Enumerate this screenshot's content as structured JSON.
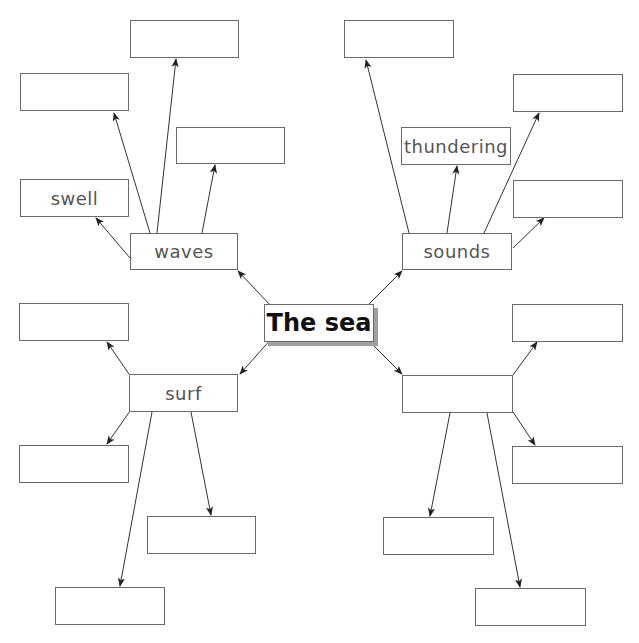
{
  "diagram": {
    "type": "mind-map",
    "center": {
      "label": "The sea",
      "x": 264,
      "y": 304,
      "w": 110,
      "h": 38
    },
    "branches": [
      {
        "id": "waves",
        "label": "waves",
        "box": {
          "x": 130,
          "y": 233,
          "w": 108,
          "h": 37
        },
        "children": [
          {
            "label": "",
            "box": {
              "x": 130,
              "y": 20,
              "w": 109,
              "h": 38
            }
          },
          {
            "label": "",
            "box": {
              "x": 20,
              "y": 73,
              "w": 109,
              "h": 38
            }
          },
          {
            "label": "",
            "box": {
              "x": 176,
              "y": 127,
              "w": 109,
              "h": 37
            }
          },
          {
            "label": "swell",
            "box": {
              "x": 20,
              "y": 179,
              "w": 109,
              "h": 38
            }
          }
        ]
      },
      {
        "id": "sounds",
        "label": "sounds",
        "box": {
          "x": 402,
          "y": 233,
          "w": 110,
          "h": 37
        },
        "children": [
          {
            "label": "",
            "box": {
              "x": 344,
              "y": 20,
              "w": 110,
              "h": 38
            }
          },
          {
            "label": "",
            "box": {
              "x": 513,
              "y": 74,
              "w": 110,
              "h": 38
            }
          },
          {
            "label": "thundering",
            "box": {
              "x": 401,
              "y": 127,
              "w": 110,
              "h": 38
            }
          },
          {
            "label": "",
            "box": {
              "x": 513,
              "y": 180,
              "w": 110,
              "h": 38
            }
          }
        ]
      },
      {
        "id": "surf",
        "label": "surf",
        "box": {
          "x": 129,
          "y": 374,
          "w": 109,
          "h": 38
        },
        "children": [
          {
            "label": "",
            "box": {
              "x": 19,
              "y": 303,
              "w": 110,
              "h": 38
            }
          },
          {
            "label": "",
            "box": {
              "x": 19,
              "y": 445,
              "w": 110,
              "h": 38
            }
          },
          {
            "label": "",
            "box": {
              "x": 147,
              "y": 516,
              "w": 109,
              "h": 38
            }
          },
          {
            "label": "",
            "box": {
              "x": 55,
              "y": 587,
              "w": 110,
              "h": 38
            }
          }
        ]
      },
      {
        "id": "unnamed",
        "label": "",
        "box": {
          "x": 402,
          "y": 375,
          "w": 111,
          "h": 38
        },
        "children": [
          {
            "label": "",
            "box": {
              "x": 512,
              "y": 304,
              "w": 111,
              "h": 38
            }
          },
          {
            "label": "",
            "box": {
              "x": 512,
              "y": 446,
              "w": 111,
              "h": 38
            }
          },
          {
            "label": "",
            "box": {
              "x": 383,
              "y": 517,
              "w": 111,
              "h": 38
            }
          },
          {
            "label": "",
            "box": {
              "x": 475,
              "y": 588,
              "w": 111,
              "h": 38
            }
          }
        ]
      }
    ],
    "arrows": [
      {
        "from": [
          272,
          307
        ],
        "to": [
          238,
          271
        ]
      },
      {
        "from": [
          366,
          307
        ],
        "to": [
          402,
          271
        ]
      },
      {
        "from": [
          272,
          338
        ],
        "to": [
          240,
          374
        ]
      },
      {
        "from": [
          366,
          338
        ],
        "to": [
          402,
          374
        ]
      },
      {
        "from": [
          157,
          233
        ],
        "to": [
          176,
          59
        ]
      },
      {
        "from": [
          150,
          233
        ],
        "to": [
          114,
          113
        ]
      },
      {
        "from": [
          202,
          233
        ],
        "to": [
          215,
          165
        ]
      },
      {
        "from": [
          130,
          258
        ],
        "to": [
          96,
          218
        ]
      },
      {
        "from": [
          409,
          233
        ],
        "to": [
          366,
          60
        ]
      },
      {
        "from": [
          447,
          233
        ],
        "to": [
          457,
          166
        ]
      },
      {
        "from": [
          484,
          233
        ],
        "to": [
          539,
          113
        ]
      },
      {
        "from": [
          513,
          248
        ],
        "to": [
          544,
          218
        ]
      },
      {
        "from": [
          129,
          374
        ],
        "to": [
          107,
          342
        ]
      },
      {
        "from": [
          130,
          411
        ],
        "to": [
          107,
          444
        ]
      },
      {
        "from": [
          191,
          412
        ],
        "to": [
          211,
          515
        ]
      },
      {
        "from": [
          152,
          412
        ],
        "to": [
          120,
          586
        ]
      },
      {
        "from": [
          513,
          375
        ],
        "to": [
          537,
          342
        ]
      },
      {
        "from": [
          513,
          412
        ],
        "to": [
          535,
          445
        ]
      },
      {
        "from": [
          450,
          413
        ],
        "to": [
          430,
          516
        ]
      },
      {
        "from": [
          487,
          413
        ],
        "to": [
          520,
          587
        ]
      }
    ],
    "style": {
      "line_color": "#333333",
      "border_color": "#6a6a6a",
      "text_color": "#555555",
      "center_text_color": "#111111",
      "shadow_color": "#a0a0a0"
    }
  }
}
